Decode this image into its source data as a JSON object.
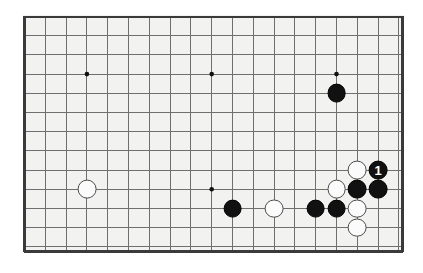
{
  "figure": {
    "kind": "go-board-diagram",
    "background_color": "#ffffff",
    "board_color": "#f2f2f0",
    "border_color": "#3a3a3a",
    "line_color": "#6f6f6f",
    "board_left": 23,
    "board_top": 15,
    "board_width": 381,
    "board_height": 238
  },
  "board": {
    "columns": 18,
    "rows": 12,
    "cell_width": 20.8,
    "cell_height": 19.2,
    "origin_x": 3,
    "origin_y": 3,
    "star_points": [
      {
        "col": 3,
        "row": 3
      },
      {
        "col": 9,
        "row": 3
      },
      {
        "col": 15,
        "row": 3
      },
      {
        "col": 9,
        "row": 9
      }
    ]
  },
  "stones": [
    {
      "color": "white",
      "col": 3,
      "row": 9,
      "label": ""
    },
    {
      "color": "black",
      "col": 15,
      "row": 4,
      "label": ""
    },
    {
      "color": "black",
      "col": 10,
      "row": 10,
      "label": ""
    },
    {
      "color": "white",
      "col": 12,
      "row": 10,
      "label": ""
    },
    {
      "color": "black",
      "col": 14,
      "row": 10,
      "label": ""
    },
    {
      "color": "black",
      "col": 15,
      "row": 10,
      "label": ""
    },
    {
      "color": "white",
      "col": 15,
      "row": 9,
      "label": ""
    },
    {
      "color": "white",
      "col": 16,
      "row": 8,
      "label": ""
    },
    {
      "color": "black",
      "col": 16,
      "row": 9,
      "label": ""
    },
    {
      "color": "white",
      "col": 16,
      "row": 10,
      "label": ""
    },
    {
      "color": "white",
      "col": 16,
      "row": 11,
      "label": ""
    },
    {
      "color": "black",
      "col": 17,
      "row": 8,
      "label": "1"
    },
    {
      "color": "black",
      "col": 17,
      "row": 9,
      "label": ""
    }
  ],
  "stone_radius": 9.4,
  "marked_move": {
    "label": "1",
    "color": "black",
    "col": 17,
    "row": 8
  }
}
